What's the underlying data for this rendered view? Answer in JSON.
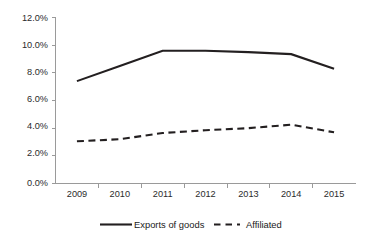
{
  "chart_data": {
    "type": "line",
    "title": "",
    "subtitle": "",
    "xlabel": "",
    "ylabel": "",
    "categories": [
      "2009",
      "2010",
      "2011",
      "2012",
      "2013",
      "2014",
      "2015"
    ],
    "ytick_labels": [
      "0.0%",
      "2.0%",
      "4.0%",
      "6.0%",
      "8.0%",
      "10.0%",
      "12.0%"
    ],
    "ytick_values": [
      0.0,
      2.0,
      4.0,
      6.0,
      8.0,
      10.0,
      12.0
    ],
    "ylim": [
      0.0,
      12.0
    ],
    "ytick_step": 2.0,
    "grid": false,
    "legend_position": "bottom",
    "value_suffix": "%",
    "series": [
      {
        "name": "Exports of goods",
        "style": "solid",
        "color": "#231f20",
        "values": [
          7.4,
          8.5,
          9.6,
          9.6,
          9.5,
          9.35,
          8.3
        ]
      },
      {
        "name": "Affiliated",
        "style": "dashed",
        "color": "#231f20",
        "values": [
          3.05,
          3.2,
          3.65,
          3.85,
          4.0,
          4.25,
          3.7
        ]
      }
    ],
    "annotations": []
  },
  "legend": {
    "items": [
      {
        "label": "Exports of goods",
        "style": "solid"
      },
      {
        "label": "Affiliated",
        "style": "dashed"
      }
    ]
  },
  "axis_colors": {
    "axis": "#9a9a9a",
    "series": "#231f20",
    "text": "#1a1a1a"
  }
}
